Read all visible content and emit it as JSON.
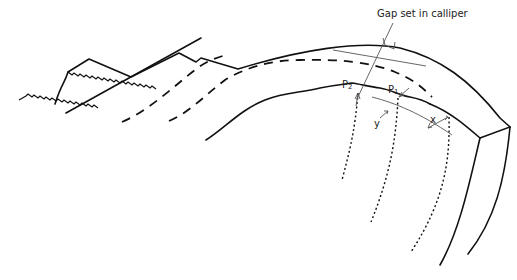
{
  "diagram": {
    "title_label": "Gap set in calliper",
    "point_labels": {
      "p2": "P",
      "p2_sub": "2",
      "p1": "P",
      "p1_sub": "1"
    },
    "dimension_labels": {
      "x": "x",
      "y": "y"
    },
    "colors": {
      "line": "#111111",
      "thin_line": "#555555",
      "background": "#ffffff"
    }
  }
}
